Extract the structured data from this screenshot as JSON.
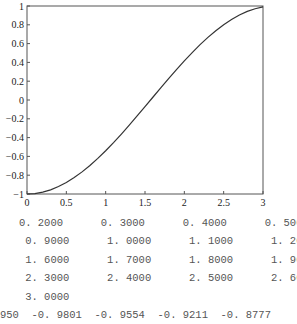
{
  "chart_data": {
    "type": "line",
    "title": "",
    "xlabel": "",
    "ylabel": "",
    "xlim": [
      0,
      3
    ],
    "ylim": [
      -1,
      1
    ],
    "grid": false,
    "legend": null,
    "x_ticks": [
      "0",
      "0.5",
      "1",
      "1.5",
      "2",
      "2.5",
      "3"
    ],
    "y_ticks": [
      "1",
      "0.8",
      "0.6",
      "0.4",
      "0.2",
      "0",
      "-0.2",
      "-0.4",
      "-0.6",
      "-0.8",
      "-1"
    ],
    "series": [
      {
        "name": "y = -cos(x)",
        "x": [
          0,
          0.1,
          0.2,
          0.3,
          0.4,
          0.5,
          0.6,
          0.7,
          0.8,
          0.9,
          1.0,
          1.1,
          1.2,
          1.3,
          1.4,
          1.5,
          1.6,
          1.7,
          1.8,
          1.9,
          2.0,
          2.1,
          2.2,
          2.3,
          2.4,
          2.5,
          2.6,
          2.7,
          2.8,
          2.9,
          3.0
        ],
        "y": [
          -1.0,
          -0.995,
          -0.9801,
          -0.9554,
          -0.9211,
          -0.8776,
          -0.8253,
          -0.7648,
          -0.6967,
          -0.6216,
          -0.5403,
          -0.4536,
          -0.3624,
          -0.2675,
          -0.17,
          -0.0707,
          0.0292,
          0.1288,
          0.2272,
          0.3233,
          0.4161,
          0.5048,
          0.5885,
          0.6663,
          0.7374,
          0.8011,
          0.8569,
          0.9041,
          0.9422,
          0.971,
          0.99
        ],
        "color": "#333333"
      }
    ]
  },
  "console_output": {
    "rows": [
      "   0. 2000      0. 3000      0. 4000      0. 5000      0. 6000",
      "    0. 9000      1. 0000      1. 1000      1. 2000      1. 3000",
      "    1. 6000      1. 7000      1. 8000      1. 9000      2. 0000",
      "    2. 3000      2. 4000      2. 5000      2. 6000      2. 7000",
      "    3. 0000",
      "950  -0. 9801  -0. 9554  -0. 9211  -0. 8777"
    ]
  }
}
